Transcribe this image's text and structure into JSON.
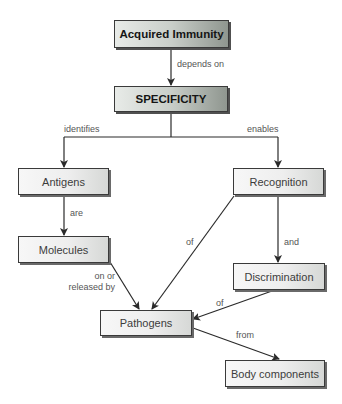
{
  "nodes": {
    "acquired_immunity": "Acquired Immunity",
    "specificity": "SPECIFICITY",
    "antigens": "Antigens",
    "recognition": "Recognition",
    "molecules": "Molecules",
    "discrimination": "Discrimination",
    "pathogens": "Pathogens",
    "body_components": "Body components"
  },
  "links": {
    "depends_on": "depends on",
    "identifies": "identifies",
    "enables": "enables",
    "are": "are",
    "of_recognition": "of",
    "and": "and",
    "on_or": "on or",
    "released_by": "released by",
    "of_discrimination": "of",
    "from": "from"
  },
  "colors": {
    "line": "#2a2a2a",
    "box_border": "#3a3a3a",
    "label_text": "#555555"
  }
}
